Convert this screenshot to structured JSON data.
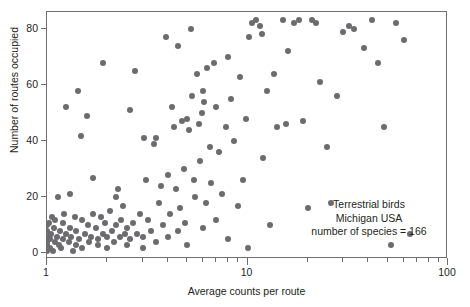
{
  "chart_data": {
    "type": "scatter",
    "title": "",
    "xlabel": "Average counts per route",
    "ylabel": "Number of routes occupied",
    "xscale": "log",
    "yscale": "linear",
    "xlim": [
      1,
      100
    ],
    "ylim": [
      -2,
      86
    ],
    "grid": false,
    "legend": null,
    "xticks_major": [
      1,
      10,
      100
    ],
    "xtick_labels": [
      "1",
      "10",
      "100"
    ],
    "xticks_minor": [
      2,
      3,
      4,
      5,
      6,
      7,
      8,
      9,
      20,
      30,
      40,
      50,
      60,
      70,
      80,
      90
    ],
    "yticks": [
      0,
      20,
      40,
      60,
      80
    ],
    "ytick_labels": [
      "0",
      "20",
      "40",
      "60",
      "80"
    ],
    "marker_color": "#6b6b70",
    "marker_size": 6,
    "frame_color": "#6e6e73",
    "annotation": {
      "line1": "Terrestrial birds",
      "line2": "Michigan USA",
      "line3": "number of species = 166"
    },
    "n_points": 166,
    "points": [
      [
        1.0,
        1
      ],
      [
        1.0,
        2
      ],
      [
        1.0,
        3
      ],
      [
        1.0,
        4
      ],
      [
        1.0,
        6
      ],
      [
        1.0,
        8
      ],
      [
        1.0,
        10
      ],
      [
        1.02,
        11
      ],
      [
        1.03,
        5
      ],
      [
        1.04,
        2
      ],
      [
        1.05,
        7
      ],
      [
        1.06,
        13
      ],
      [
        1.07,
        1
      ],
      [
        1.08,
        9
      ],
      [
        1.1,
        4
      ],
      [
        1.1,
        12
      ],
      [
        1.12,
        6
      ],
      [
        1.13,
        20
      ],
      [
        1.15,
        3
      ],
      [
        1.16,
        8
      ],
      [
        1.18,
        2
      ],
      [
        1.2,
        5
      ],
      [
        1.2,
        11
      ],
      [
        1.22,
        14
      ],
      [
        1.25,
        7
      ],
      [
        1.25,
        52
      ],
      [
        1.28,
        4
      ],
      [
        1.3,
        9
      ],
      [
        1.3,
        21
      ],
      [
        1.32,
        6
      ],
      [
        1.35,
        1
      ],
      [
        1.38,
        13
      ],
      [
        1.4,
        3
      ],
      [
        1.4,
        8
      ],
      [
        1.42,
        58
      ],
      [
        1.45,
        5
      ],
      [
        1.48,
        42
      ],
      [
        1.5,
        12
      ],
      [
        1.5,
        2
      ],
      [
        1.55,
        7
      ],
      [
        1.58,
        49
      ],
      [
        1.6,
        10
      ],
      [
        1.62,
        4
      ],
      [
        1.65,
        6
      ],
      [
        1.7,
        14
      ],
      [
        1.7,
        27
      ],
      [
        1.75,
        9
      ],
      [
        1.8,
        3
      ],
      [
        1.8,
        5
      ],
      [
        1.85,
        13
      ],
      [
        1.9,
        7
      ],
      [
        1.9,
        68
      ],
      [
        1.95,
        11
      ],
      [
        2.0,
        2
      ],
      [
        2.0,
        6
      ],
      [
        2.05,
        15
      ],
      [
        2.1,
        8
      ],
      [
        2.15,
        4
      ],
      [
        2.2,
        20
      ],
      [
        2.2,
        10
      ],
      [
        2.25,
        23
      ],
      [
        2.3,
        6
      ],
      [
        2.35,
        12
      ],
      [
        2.4,
        17
      ],
      [
        2.45,
        7
      ],
      [
        2.5,
        3
      ],
      [
        2.5,
        9
      ],
      [
        2.6,
        5
      ],
      [
        2.6,
        51
      ],
      [
        2.7,
        11
      ],
      [
        2.75,
        65
      ],
      [
        2.8,
        7
      ],
      [
        2.9,
        14
      ],
      [
        3.0,
        2
      ],
      [
        3.0,
        6
      ],
      [
        3.05,
        41
      ],
      [
        3.1,
        26
      ],
      [
        3.2,
        12
      ],
      [
        3.3,
        8
      ],
      [
        3.4,
        39
      ],
      [
        3.5,
        4
      ],
      [
        3.5,
        41
      ],
      [
        3.6,
        18
      ],
      [
        3.7,
        24
      ],
      [
        3.8,
        10
      ],
      [
        3.9,
        77
      ],
      [
        4.0,
        6
      ],
      [
        4.0,
        28
      ],
      [
        4.1,
        14
      ],
      [
        4.2,
        52
      ],
      [
        4.3,
        45
      ],
      [
        4.4,
        23
      ],
      [
        4.5,
        8
      ],
      [
        4.5,
        74
      ],
      [
        4.6,
        16
      ],
      [
        4.7,
        47
      ],
      [
        4.8,
        30
      ],
      [
        4.9,
        11
      ],
      [
        5.0,
        3
      ],
      [
        5.0,
        48
      ],
      [
        5.1,
        44
      ],
      [
        5.2,
        80
      ],
      [
        5.3,
        56
      ],
      [
        5.4,
        26
      ],
      [
        5.5,
        20
      ],
      [
        5.6,
        64
      ],
      [
        5.7,
        46
      ],
      [
        5.8,
        33
      ],
      [
        5.9,
        50
      ],
      [
        6.0,
        9
      ],
      [
        6.0,
        58
      ],
      [
        6.1,
        54
      ],
      [
        6.2,
        18
      ],
      [
        6.3,
        66
      ],
      [
        6.5,
        38
      ],
      [
        6.6,
        25
      ],
      [
        6.8,
        68
      ],
      [
        7.0,
        12
      ],
      [
        7.0,
        52
      ],
      [
        7.2,
        36
      ],
      [
        7.5,
        21
      ],
      [
        7.8,
        45
      ],
      [
        8.0,
        5
      ],
      [
        8.0,
        70
      ],
      [
        8.3,
        55
      ],
      [
        8.6,
        40
      ],
      [
        9.0,
        17
      ],
      [
        9.2,
        63
      ],
      [
        9.5,
        26
      ],
      [
        9.8,
        48
      ],
      [
        10.0,
        2
      ],
      [
        10.2,
        77
      ],
      [
        10.5,
        82
      ],
      [
        11.0,
        83
      ],
      [
        11.5,
        81
      ],
      [
        11.8,
        78
      ],
      [
        12.0,
        34
      ],
      [
        12.5,
        58
      ],
      [
        13.0,
        10
      ],
      [
        13.5,
        64
      ],
      [
        14.0,
        45
      ],
      [
        15.0,
        83
      ],
      [
        15.5,
        46
      ],
      [
        16.0,
        72
      ],
      [
        17.0,
        82
      ],
      [
        18.0,
        83
      ],
      [
        19.0,
        47
      ],
      [
        20.0,
        16
      ],
      [
        21.0,
        83
      ],
      [
        22.0,
        82
      ],
      [
        23.0,
        61
      ],
      [
        25.0,
        38
      ],
      [
        26.0,
        18
      ],
      [
        28.0,
        56
      ],
      [
        30.0,
        79
      ],
      [
        32.0,
        81
      ],
      [
        34.0,
        80
      ],
      [
        38.0,
        73
      ],
      [
        42.0,
        83
      ],
      [
        45.0,
        68
      ],
      [
        48.0,
        45
      ],
      [
        52.0,
        3
      ],
      [
        55.0,
        82
      ],
      [
        60.0,
        76
      ],
      [
        65.0,
        7
      ]
    ]
  }
}
